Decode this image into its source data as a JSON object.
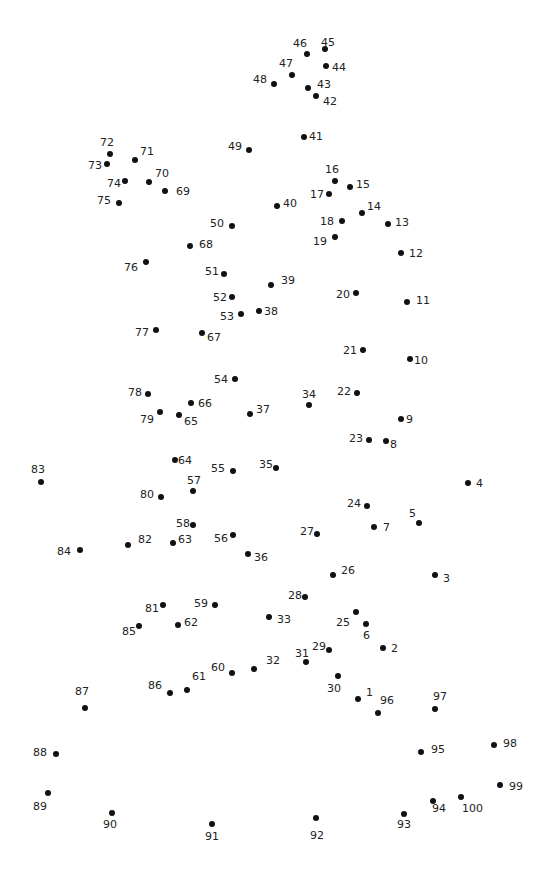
{
  "puzzle": {
    "type": "connect-the-dots",
    "dot_color": "#111111",
    "label_color": "#222222",
    "background": "#ffffff",
    "points": [
      {
        "n": "1",
        "x": 358,
        "y": 699,
        "lx": 366,
        "ly": 687
      },
      {
        "n": "2",
        "x": 383,
        "y": 648,
        "lx": 391,
        "ly": 643
      },
      {
        "n": "3",
        "x": 435,
        "y": 575,
        "lx": 443,
        "ly": 573
      },
      {
        "n": "4",
        "x": 468,
        "y": 483,
        "lx": 476,
        "ly": 478
      },
      {
        "n": "5",
        "x": 419,
        "y": 523,
        "lx": 409,
        "ly": 508
      },
      {
        "n": "6",
        "x": 366,
        "y": 624,
        "lx": 363,
        "ly": 630
      },
      {
        "n": "7",
        "x": 374,
        "y": 527,
        "lx": 383,
        "ly": 522
      },
      {
        "n": "8",
        "x": 386,
        "y": 441,
        "lx": 390,
        "ly": 439
      },
      {
        "n": "9",
        "x": 401,
        "y": 419,
        "lx": 406,
        "ly": 414
      },
      {
        "n": "10",
        "x": 410,
        "y": 359,
        "lx": 414,
        "ly": 355
      },
      {
        "n": "11",
        "x": 407,
        "y": 302,
        "lx": 416,
        "ly": 295
      },
      {
        "n": "12",
        "x": 401,
        "y": 253,
        "lx": 409,
        "ly": 248
      },
      {
        "n": "13",
        "x": 388,
        "y": 224,
        "lx": 395,
        "ly": 217
      },
      {
        "n": "14",
        "x": 362,
        "y": 213,
        "lx": 367,
        "ly": 201
      },
      {
        "n": "15",
        "x": 350,
        "y": 187,
        "lx": 356,
        "ly": 179
      },
      {
        "n": "16",
        "x": 335,
        "y": 181,
        "lx": 325,
        "ly": 164
      },
      {
        "n": "17",
        "x": 329,
        "y": 194,
        "lx": 310,
        "ly": 189
      },
      {
        "n": "18",
        "x": 342,
        "y": 221,
        "lx": 320,
        "ly": 216
      },
      {
        "n": "19",
        "x": 335,
        "y": 237,
        "lx": 313,
        "ly": 236
      },
      {
        "n": "20",
        "x": 356,
        "y": 293,
        "lx": 336,
        "ly": 289
      },
      {
        "n": "21",
        "x": 363,
        "y": 350,
        "lx": 343,
        "ly": 345
      },
      {
        "n": "22",
        "x": 357,
        "y": 393,
        "lx": 337,
        "ly": 386
      },
      {
        "n": "23",
        "x": 369,
        "y": 440,
        "lx": 349,
        "ly": 433
      },
      {
        "n": "24",
        "x": 367,
        "y": 506,
        "lx": 347,
        "ly": 498
      },
      {
        "n": "25",
        "x": 356,
        "y": 612,
        "lx": 336,
        "ly": 617
      },
      {
        "n": "26",
        "x": 333,
        "y": 575,
        "lx": 341,
        "ly": 565
      },
      {
        "n": "27",
        "x": 317,
        "y": 534,
        "lx": 300,
        "ly": 526
      },
      {
        "n": "28",
        "x": 305,
        "y": 597,
        "lx": 288,
        "ly": 590
      },
      {
        "n": "29",
        "x": 329,
        "y": 650,
        "lx": 312,
        "ly": 641
      },
      {
        "n": "30",
        "x": 338,
        "y": 676,
        "lx": 327,
        "ly": 683
      },
      {
        "n": "31",
        "x": 306,
        "y": 662,
        "lx": 295,
        "ly": 648
      },
      {
        "n": "32",
        "x": 254,
        "y": 669,
        "lx": 266,
        "ly": 655
      },
      {
        "n": "33",
        "x": 269,
        "y": 617,
        "lx": 277,
        "ly": 614
      },
      {
        "n": "34",
        "x": 309,
        "y": 405,
        "lx": 302,
        "ly": 389
      },
      {
        "n": "35",
        "x": 276,
        "y": 468,
        "lx": 259,
        "ly": 459
      },
      {
        "n": "36",
        "x": 248,
        "y": 554,
        "lx": 254,
        "ly": 552
      },
      {
        "n": "37",
        "x": 250,
        "y": 414,
        "lx": 256,
        "ly": 404
      },
      {
        "n": "38",
        "x": 259,
        "y": 311,
        "lx": 264,
        "ly": 306
      },
      {
        "n": "39",
        "x": 271,
        "y": 285,
        "lx": 281,
        "ly": 275
      },
      {
        "n": "40",
        "x": 277,
        "y": 206,
        "lx": 283,
        "ly": 198
      },
      {
        "n": "41",
        "x": 304,
        "y": 137,
        "lx": 309,
        "ly": 131
      },
      {
        "n": "42",
        "x": 316,
        "y": 96,
        "lx": 323,
        "ly": 96
      },
      {
        "n": "43",
        "x": 308,
        "y": 88,
        "lx": 317,
        "ly": 79
      },
      {
        "n": "44",
        "x": 326,
        "y": 66,
        "lx": 332,
        "ly": 62
      },
      {
        "n": "45",
        "x": 325,
        "y": 49,
        "lx": 321,
        "ly": 37
      },
      {
        "n": "46",
        "x": 307,
        "y": 54,
        "lx": 293,
        "ly": 38
      },
      {
        "n": "47",
        "x": 292,
        "y": 75,
        "lx": 279,
        "ly": 58
      },
      {
        "n": "48",
        "x": 274,
        "y": 84,
        "lx": 253,
        "ly": 74
      },
      {
        "n": "49",
        "x": 249,
        "y": 150,
        "lx": 228,
        "ly": 141
      },
      {
        "n": "50",
        "x": 232,
        "y": 226,
        "lx": 210,
        "ly": 218
      },
      {
        "n": "51",
        "x": 224,
        "y": 274,
        "lx": 205,
        "ly": 266
      },
      {
        "n": "52",
        "x": 232,
        "y": 297,
        "lx": 213,
        "ly": 292
      },
      {
        "n": "53",
        "x": 241,
        "y": 314,
        "lx": 220,
        "ly": 311
      },
      {
        "n": "54",
        "x": 235,
        "y": 379,
        "lx": 214,
        "ly": 374
      },
      {
        "n": "55",
        "x": 233,
        "y": 471,
        "lx": 211,
        "ly": 463
      },
      {
        "n": "56",
        "x": 233,
        "y": 535,
        "lx": 214,
        "ly": 533
      },
      {
        "n": "57",
        "x": 193,
        "y": 491,
        "lx": 187,
        "ly": 475
      },
      {
        "n": "58",
        "x": 193,
        "y": 525,
        "lx": 176,
        "ly": 518
      },
      {
        "n": "59",
        "x": 215,
        "y": 605,
        "lx": 194,
        "ly": 598
      },
      {
        "n": "60",
        "x": 232,
        "y": 673,
        "lx": 211,
        "ly": 662
      },
      {
        "n": "61",
        "x": 187,
        "y": 690,
        "lx": 192,
        "ly": 671
      },
      {
        "n": "62",
        "x": 178,
        "y": 625,
        "lx": 184,
        "ly": 617
      },
      {
        "n": "63",
        "x": 173,
        "y": 543,
        "lx": 178,
        "ly": 534
      },
      {
        "n": "64",
        "x": 175,
        "y": 460,
        "lx": 178,
        "ly": 455
      },
      {
        "n": "65",
        "x": 179,
        "y": 415,
        "lx": 184,
        "ly": 416
      },
      {
        "n": "66",
        "x": 191,
        "y": 403,
        "lx": 198,
        "ly": 398
      },
      {
        "n": "67",
        "x": 202,
        "y": 333,
        "lx": 207,
        "ly": 332
      },
      {
        "n": "68",
        "x": 190,
        "y": 246,
        "lx": 199,
        "ly": 239
      },
      {
        "n": "69",
        "x": 165,
        "y": 191,
        "lx": 176,
        "ly": 186
      },
      {
        "n": "70",
        "x": 149,
        "y": 182,
        "lx": 155,
        "ly": 168
      },
      {
        "n": "71",
        "x": 135,
        "y": 160,
        "lx": 140,
        "ly": 146
      },
      {
        "n": "72",
        "x": 110,
        "y": 154,
        "lx": 100,
        "ly": 137
      },
      {
        "n": "73",
        "x": 107,
        "y": 164,
        "lx": 88,
        "ly": 160
      },
      {
        "n": "74",
        "x": 125,
        "y": 181,
        "lx": 107,
        "ly": 178
      },
      {
        "n": "75",
        "x": 119,
        "y": 203,
        "lx": 97,
        "ly": 195
      },
      {
        "n": "76",
        "x": 146,
        "y": 262,
        "lx": 124,
        "ly": 262
      },
      {
        "n": "77",
        "x": 156,
        "y": 330,
        "lx": 135,
        "ly": 327
      },
      {
        "n": "78",
        "x": 148,
        "y": 394,
        "lx": 128,
        "ly": 387
      },
      {
        "n": "79",
        "x": 160,
        "y": 412,
        "lx": 140,
        "ly": 414
      },
      {
        "n": "80",
        "x": 161,
        "y": 497,
        "lx": 140,
        "ly": 489
      },
      {
        "n": "81",
        "x": 163,
        "y": 605,
        "lx": 145,
        "ly": 603
      },
      {
        "n": "82",
        "x": 128,
        "y": 545,
        "lx": 138,
        "ly": 534
      },
      {
        "n": "83",
        "x": 41,
        "y": 482,
        "lx": 31,
        "ly": 464
      },
      {
        "n": "84",
        "x": 80,
        "y": 550,
        "lx": 57,
        "ly": 546
      },
      {
        "n": "85",
        "x": 139,
        "y": 626,
        "lx": 122,
        "ly": 626
      },
      {
        "n": "86",
        "x": 170,
        "y": 693,
        "lx": 148,
        "ly": 680
      },
      {
        "n": "87",
        "x": 85,
        "y": 708,
        "lx": 75,
        "ly": 686
      },
      {
        "n": "88",
        "x": 56,
        "y": 754,
        "lx": 33,
        "ly": 747
      },
      {
        "n": "89",
        "x": 48,
        "y": 793,
        "lx": 33,
        "ly": 801
      },
      {
        "n": "90",
        "x": 112,
        "y": 813,
        "lx": 103,
        "ly": 819
      },
      {
        "n": "91",
        "x": 212,
        "y": 824,
        "lx": 205,
        "ly": 831
      },
      {
        "n": "92",
        "x": 316,
        "y": 818,
        "lx": 310,
        "ly": 830
      },
      {
        "n": "93",
        "x": 404,
        "y": 814,
        "lx": 397,
        "ly": 819
      },
      {
        "n": "94",
        "x": 433,
        "y": 801,
        "lx": 432,
        "ly": 803
      },
      {
        "n": "95",
        "x": 421,
        "y": 752,
        "lx": 431,
        "ly": 744
      },
      {
        "n": "96",
        "x": 378,
        "y": 713,
        "lx": 380,
        "ly": 695
      },
      {
        "n": "97",
        "x": 435,
        "y": 709,
        "lx": 433,
        "ly": 691
      },
      {
        "n": "98",
        "x": 494,
        "y": 745,
        "lx": 503,
        "ly": 738
      },
      {
        "n": "99",
        "x": 500,
        "y": 785,
        "lx": 509,
        "ly": 781
      },
      {
        "n": "100",
        "x": 461,
        "y": 797,
        "lx": 462,
        "ly": 803
      }
    ]
  }
}
